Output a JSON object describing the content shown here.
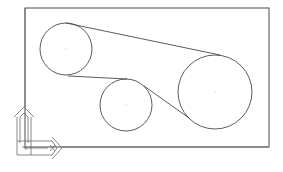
{
  "drawing": {
    "background": "#ffffff",
    "stroke_color": "#4a4a4a",
    "center_mark_color": "#bdbdbd",
    "boundary": {
      "x": 25,
      "y": 8,
      "width": 244,
      "height": 139
    },
    "pulleys": [
      {
        "id": "pulley-1",
        "cx": 66,
        "cy": 49,
        "r": 26
      },
      {
        "id": "pulley-2",
        "cx": 126,
        "cy": 105,
        "r": 26
      },
      {
        "id": "pulley-3",
        "cx": 215,
        "cy": 92,
        "r": 37
      }
    ],
    "belt_segments": [
      {
        "x1": 66,
        "y1": 23,
        "x2": 220,
        "y2": 55
      },
      {
        "x1": 68,
        "y1": 76,
        "x2": 127,
        "y2": 79
      },
      {
        "x1": 144,
        "y1": 86,
        "x2": 189,
        "y2": 118
      }
    ],
    "ucs_icon": {
      "origin_x": 18,
      "origin_y": 155,
      "x_label": "X",
      "y_label": "Y"
    }
  }
}
